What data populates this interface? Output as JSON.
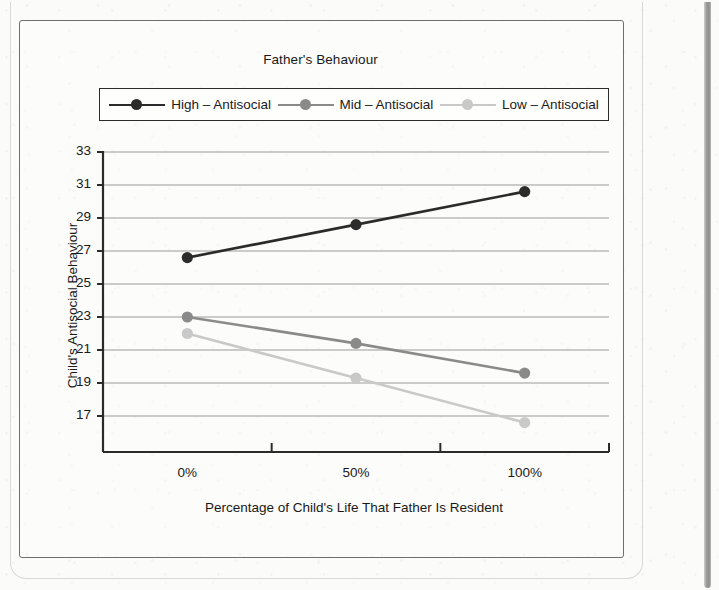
{
  "figure": {
    "title": "Father's Behaviour"
  },
  "chart_data": {
    "type": "line",
    "title": "Father's Behaviour",
    "xlabel": "Percentage of Child's Life That Father Is Resident",
    "ylabel": "Child's Antisocial Behaviour",
    "categories": [
      "0%",
      "50%",
      "100%"
    ],
    "series": [
      {
        "name": "High – Antisocial",
        "color": "#2b2b2b",
        "values": [
          26.6,
          28.6,
          30.6
        ]
      },
      {
        "name": "Mid – Antisocial",
        "color": "#8a8a8a",
        "values": [
          23.0,
          21.4,
          19.6
        ]
      },
      {
        "name": "Low – Antisocial",
        "color": "#c9c9c9",
        "values": [
          22.0,
          19.3,
          16.6
        ]
      }
    ],
    "ylim": [
      15.5,
      33.0
    ],
    "yticks": [
      33,
      31,
      29,
      27,
      25,
      23,
      21,
      19,
      17
    ],
    "ytick_labels": [
      "33",
      "31",
      "29",
      "27",
      "25",
      "23",
      "21",
      "19",
      "17"
    ],
    "xtick_labels": [
      "0%",
      "50%",
      "100%"
    ],
    "grid": "horizontal",
    "grid_color": "#9a9a9a",
    "legend_position": "top",
    "axis_color": "#2b2b2b"
  },
  "legend": {
    "items": [
      {
        "label": "High – Antisocial"
      },
      {
        "label": "Mid – Antisocial"
      },
      {
        "label": "Low – Antisocial"
      }
    ]
  }
}
